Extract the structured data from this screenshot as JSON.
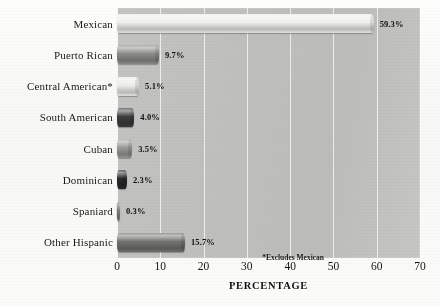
{
  "chart_data": {
    "type": "bar",
    "orientation": "horizontal",
    "title": "",
    "xlabel": "PERCENTAGE",
    "ylabel": "",
    "xlim": [
      0,
      70
    ],
    "xticks": [
      "0",
      "10",
      "20",
      "30",
      "40",
      "50",
      "60",
      "70"
    ],
    "grid": true,
    "legend": "none",
    "footnote": "*Excludes Mexican",
    "categories": [
      "Mexican",
      "Puerto Rican",
      "Central American*",
      "South American",
      "Cuban",
      "Dominican",
      "Spaniard",
      "Other Hispanic"
    ],
    "values": [
      59.3,
      9.7,
      5.1,
      4.0,
      3.5,
      2.3,
      0.3,
      15.7
    ],
    "value_labels": [
      "59.3%",
      "9.7%",
      "5.1%",
      "4.0%",
      "3.5%",
      "2.3%",
      "0.3%",
      "15.7%"
    ],
    "bar_colors": [
      "#eeeeec",
      "#8d8d8b",
      "#ececeb",
      "#3e3e3e",
      "#9b9b99",
      "#2a2a2a",
      "#8a8a88",
      "#737371"
    ],
    "plot_background": "#c0c0be",
    "gridline_color": "#ffffff",
    "page_background": "#fbfbfa"
  }
}
